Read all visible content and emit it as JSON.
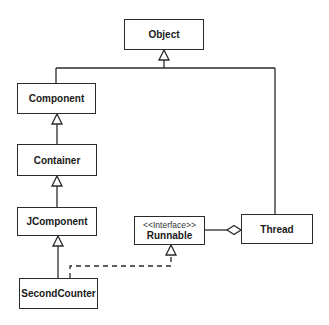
{
  "diagram": {
    "type": "UML class diagram",
    "classes": [
      {
        "id": "object",
        "name": "Object"
      },
      {
        "id": "component",
        "name": "Component"
      },
      {
        "id": "container",
        "name": "Container"
      },
      {
        "id": "jcomponent",
        "name": "JComponent"
      },
      {
        "id": "secondcounter",
        "name": "SecondCounter"
      },
      {
        "id": "runnable",
        "name": "Runnable",
        "stereotype": "<<Interface>>"
      },
      {
        "id": "thread",
        "name": "Thread"
      }
    ],
    "relationships": [
      {
        "from": "Component",
        "to": "Object",
        "kind": "generalization"
      },
      {
        "from": "Thread",
        "to": "Object",
        "kind": "generalization"
      },
      {
        "from": "Container",
        "to": "Component",
        "kind": "generalization"
      },
      {
        "from": "JComponent",
        "to": "Container",
        "kind": "generalization"
      },
      {
        "from": "SecondCounter",
        "to": "JComponent",
        "kind": "generalization"
      },
      {
        "from": "SecondCounter",
        "to": "Runnable",
        "kind": "realization"
      },
      {
        "from": "Thread",
        "to": "Runnable",
        "kind": "aggregation"
      }
    ]
  },
  "colors": {
    "line": "#2a2a2a",
    "background": "#ffffff"
  }
}
